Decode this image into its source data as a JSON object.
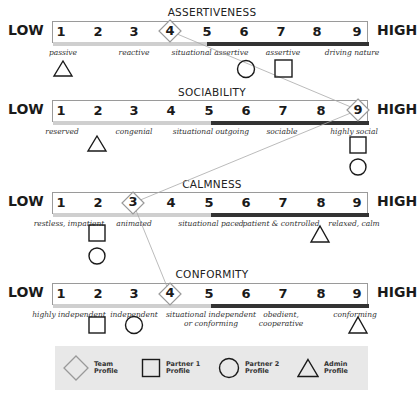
{
  "scale": {
    "low_label": "LOW",
    "high_label": "HIGH",
    "numbers": [
      "1",
      "2",
      "3",
      "4",
      "5",
      "6",
      "7",
      "8",
      "9"
    ]
  },
  "scales": [
    {
      "title": "ASSERTIVENESS",
      "descriptors": [
        {
          "text": "passive",
          "position": 1
        },
        {
          "text": "reactive",
          "position": 3
        },
        {
          "text": "situational assertive",
          "position": 5
        },
        {
          "text": "assertive",
          "position": 7
        },
        {
          "text": "driving nature",
          "position": 9
        }
      ],
      "markers": {
        "team": 4,
        "partner1": 7,
        "partner2": 6,
        "admin": 1
      }
    },
    {
      "title": "SOCIABILITY",
      "descriptors": [
        {
          "text": "reserved",
          "position": 1
        },
        {
          "text": "congenial",
          "position": 3
        },
        {
          "text": "situational outgoing",
          "position": 5
        },
        {
          "text": "sociable",
          "position": 7
        },
        {
          "text": "highly social",
          "position": 9
        }
      ],
      "markers": {
        "team": 9,
        "partner1": 9,
        "partner2": 9,
        "admin": 2
      }
    },
    {
      "title": "CALMNESS",
      "descriptors": [
        {
          "text": "restless, impatient",
          "position": 1.5
        },
        {
          "text": "animated",
          "position": 3
        },
        {
          "text": "situational paced",
          "position": 5
        },
        {
          "text": "patient & controlled",
          "position": 7
        },
        {
          "text": "relaxed, calm",
          "position": 9
        }
      ],
      "markers": {
        "team": 3,
        "partner1": 2,
        "partner2": 2,
        "admin": 8
      }
    },
    {
      "title": "CONFORMITY",
      "descriptors": [
        {
          "text": "highly independent",
          "position": 1.5
        },
        {
          "text": "independent",
          "position": 3
        },
        {
          "text": "situational independent\nor conforming",
          "position": 5
        },
        {
          "text": "obedient,\ncooperative",
          "position": 7
        },
        {
          "text": "conforming",
          "position": 9
        }
      ],
      "markers": {
        "team": 4,
        "partner1": 2,
        "partner2": 3,
        "admin": 9
      }
    }
  ],
  "legend": {
    "team": "Team\nProfile",
    "partner1": "Partner 1\nProfile",
    "partner2": "Partner 2\nProfile",
    "admin": "Admin\nProfile"
  },
  "colors": {
    "team_marker": "#9a9a9a",
    "markers": "#1a1a1a",
    "legend_bg": "#e8e8e8",
    "bar_under_dark": "#333333",
    "bar_under_light": "#cfcfcf"
  }
}
